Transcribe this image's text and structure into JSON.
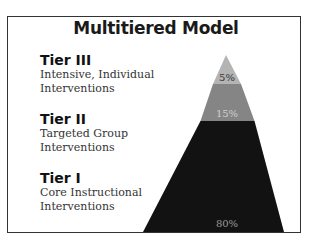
{
  "title": "Multitiered Model",
  "tiers": [
    {
      "name": "Tier III",
      "line1": "Intensive, Individual",
      "line2": "Interventions",
      "percent": "5%",
      "color": "#b4b4b4",
      "label_color": "#333333"
    },
    {
      "name": "Tier II",
      "line1": "Targeted Group",
      "line2": "Interventions",
      "percent": "15%",
      "color": "#858585",
      "label_color": "#cfcfcf"
    },
    {
      "name": "Tier I",
      "line1": "Core Instructional",
      "line2": "Interventions",
      "percent": "80%",
      "color": "#121212",
      "label_color": "#9a9a9a"
    }
  ]
}
